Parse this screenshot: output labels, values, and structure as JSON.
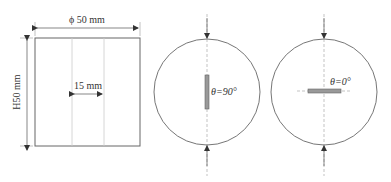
{
  "specimen": {
    "diameter_label": "ϕ 50 mm",
    "height_label": "H50 mm",
    "crack_length_label": "15 mm"
  },
  "disc_left": {
    "angle_label": "θ=90°"
  },
  "disc_right": {
    "angle_label": "θ=0°"
  },
  "colors": {
    "line": "#555555",
    "guide": "#bbbbbb",
    "crack": "#888888"
  }
}
